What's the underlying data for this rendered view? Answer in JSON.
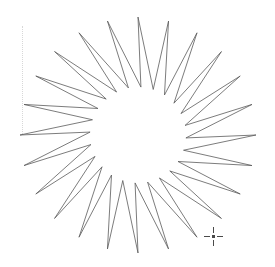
{
  "canvas": {
    "width": 275,
    "height": 267,
    "background_color": "#ffffff",
    "label": "Drawing canvas"
  },
  "guide": {
    "name": "vertical-guide-line",
    "x": 22,
    "y": 26,
    "length": 108,
    "color": "#d8d8d8",
    "style": "dotted"
  },
  "cursor": {
    "name": "crosshair-cursor",
    "x": 213,
    "y": 236,
    "color": "#4a4a4a",
    "style": "dashed-crosshair"
  },
  "shape": {
    "name": "starburst-polygon",
    "type": "star",
    "points": 24,
    "center_x": 138,
    "center_y": 135,
    "outer_radius": 118,
    "inner_radius": 48,
    "skew_degrees": 11,
    "rotation_degrees": -90,
    "stroke_color": "#5a5a5a",
    "stroke_width": 0.8,
    "fill": "none",
    "bounding_box": {
      "left": 26,
      "top": 12,
      "right": 250,
      "bottom": 258
    }
  }
}
